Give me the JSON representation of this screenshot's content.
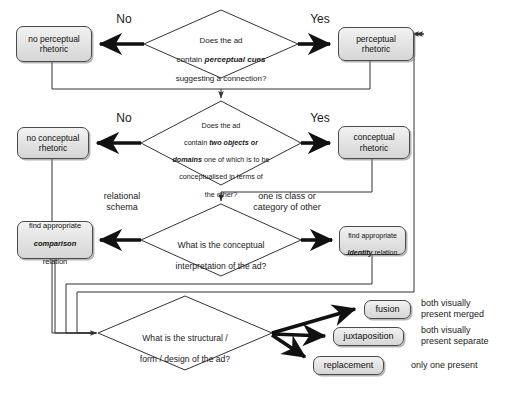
{
  "diagram": {
    "colors": {
      "node_fill_top": "#f2f2f2",
      "node_fill_bottom": "#d6d6d6",
      "node_border": "#4a4a4a",
      "line": "#333333",
      "text": "#111111",
      "background": "#ffffff"
    },
    "decisions": [
      {
        "id": "d1",
        "text": "Does the ad\ncontain perceptual cues\nsuggesting a connection?",
        "line1": "Does the ad",
        "line2_pre": "contain ",
        "line2_em": "perceptual cues",
        "line3": "suggesting a connection?",
        "cx": 221,
        "cy": 44,
        "rx": 77,
        "ry": 34
      },
      {
        "id": "d2",
        "text": "Does the ad\ncontain two objects or\ndomains one of which is to be\nconceptualised in terms of\nthe other?",
        "line1": "Does the ad",
        "line2_pre": "contain ",
        "line2_em": "two objects or",
        "line3_em": "domains",
        "line3_post": " one of which is to be",
        "line4": "conceptualised in terms of",
        "line5": "the other?",
        "cx": 221,
        "cy": 143,
        "rx": 80,
        "ry": 42
      },
      {
        "id": "d3",
        "text": "What is the conceptual\ninterpretation of the ad?",
        "line1": "What is the conceptual",
        "line2": "interpretation of the ad?",
        "cx": 221,
        "cy": 240,
        "rx": 80,
        "ry": 36
      },
      {
        "id": "d4",
        "text": "What is the structural /\nform / design of the ad?",
        "line1": "What is the structural /",
        "line2": "form / design of the ad?",
        "cx": 185,
        "cy": 333,
        "rx": 87,
        "ry": 37
      }
    ],
    "nodes": [
      {
        "id": "n1",
        "label": "no perceptual\nrhetoric",
        "x": 16,
        "y": 26,
        "w": 76,
        "h": 36,
        "font": 8.5
      },
      {
        "id": "n2",
        "label": "perceptual\nrhetoric",
        "x": 338,
        "y": 27,
        "w": 76,
        "h": 34,
        "font": 8.5
      },
      {
        "id": "n3",
        "label": "no conceptual\nrhetoric",
        "x": 17,
        "y": 127,
        "w": 72,
        "h": 32,
        "font": 8.5
      },
      {
        "id": "n4",
        "label": "conceptual\nrhetoric",
        "x": 338,
        "y": 126,
        "w": 72,
        "h": 33,
        "font": 8.5
      },
      {
        "id": "n5",
        "label": "find appropriate\ncomparison\nrelation",
        "x": 17,
        "y": 221,
        "w": 76,
        "h": 38,
        "font": 7.5,
        "em_line": 1
      },
      {
        "id": "n6",
        "label": "find appropriate\nidentity relation",
        "x": 339,
        "y": 226,
        "w": 67,
        "h": 29,
        "font": 7,
        "em_word": "identity"
      },
      {
        "id": "n7",
        "label": "fusion",
        "x": 364,
        "y": 300,
        "w": 47,
        "h": 19,
        "font": 9
      },
      {
        "id": "n8",
        "label": "juxtaposition",
        "x": 333,
        "y": 327,
        "w": 71,
        "h": 19,
        "font": 9
      },
      {
        "id": "n9",
        "label": "replacement",
        "x": 313,
        "y": 356,
        "w": 71,
        "h": 19,
        "font": 9
      }
    ],
    "edge_labels": [
      {
        "id": "e1",
        "text": "No",
        "x": 104,
        "y": 14,
        "w": 40,
        "font": 12
      },
      {
        "id": "e2",
        "text": "Yes",
        "x": 300,
        "y": 14,
        "w": 40,
        "font": 12
      },
      {
        "id": "e3",
        "text": "No",
        "x": 104,
        "y": 113,
        "w": 40,
        "font": 12
      },
      {
        "id": "e4",
        "text": "Yes",
        "x": 300,
        "y": 113,
        "w": 40,
        "font": 12
      },
      {
        "id": "e5",
        "text": "relational\nschema",
        "x": 84,
        "y": 191,
        "w": 72,
        "font": 9
      },
      {
        "id": "e6",
        "text": "one is class or\ncategory of other",
        "x": 232,
        "y": 191,
        "w": 108,
        "font": 9
      }
    ],
    "side_notes": [
      {
        "id": "s1",
        "text": "both visually\npresent merged",
        "x": 421,
        "y": 299,
        "font": 9
      },
      {
        "id": "s2",
        "text": "both visually\npresent separate",
        "x": 421,
        "y": 326,
        "font": 9
      },
      {
        "id": "s3",
        "text": "only one present",
        "x": 411,
        "y": 360,
        "font": 9
      }
    ]
  }
}
